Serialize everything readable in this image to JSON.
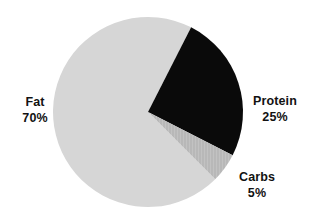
{
  "chart_data": {
    "type": "pie",
    "title": "",
    "subtitle": "",
    "xlabel": "",
    "ylabel": "",
    "grid": false,
    "legend": "none",
    "labels_position": "outside",
    "units": "percent",
    "total": 100,
    "start_angle_deg": 27,
    "direction": "clockwise",
    "categories": [
      "Protein",
      "Carbs",
      "Fat"
    ],
    "values": [
      25,
      5,
      70
    ],
    "slices": [
      {
        "name": "Protein",
        "value": 25,
        "value_label": "25%",
        "color": "#0a0a0a",
        "start_angle_deg": 27,
        "end_angle_deg": 117
      },
      {
        "name": "Carbs",
        "value": 5,
        "value_label": "5%",
        "color": "#b8b8b8",
        "start_angle_deg": 117,
        "end_angle_deg": 135
      },
      {
        "name": "Fat",
        "value": 70,
        "value_label": "70%",
        "color": "#d6d6d6",
        "start_angle_deg": 135,
        "end_angle_deg": 387
      }
    ],
    "annotations": [
      {
        "text": "Fat",
        "value_text": "70%",
        "anchor": "left"
      },
      {
        "text": "Protein",
        "value_text": "25%",
        "anchor": "right"
      },
      {
        "text": "Carbs",
        "value_text": "5%",
        "anchor": "bottom-right"
      }
    ],
    "geometry": {
      "center_x": 148,
      "center_y": 112,
      "radius": 95
    },
    "colors": {
      "background": "#ffffff",
      "text": "#121212",
      "fat": "#d6d6d6",
      "protein": "#0a0a0a",
      "carbs": "#b8b8b8"
    }
  }
}
